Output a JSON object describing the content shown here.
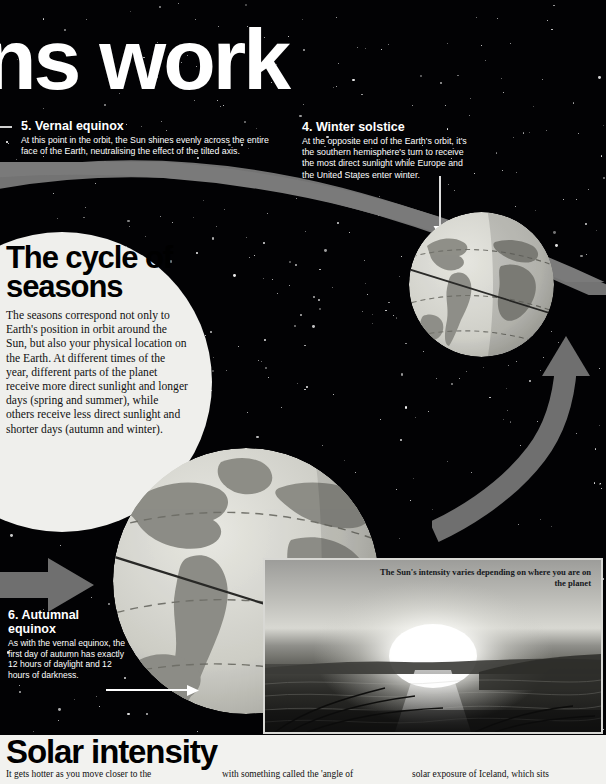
{
  "page": {
    "headline": "ns work",
    "background_color": "#020204",
    "panel_color": "#f2f2ef",
    "accent_grey": "#8a8a8a"
  },
  "annotations": [
    {
      "id": "vernal",
      "heading": "5. Vernal equinox",
      "body": "At this point in the orbit, the Sun shines evenly across the entire face of the Earth, neutralising the effect of the tilted axis."
    },
    {
      "id": "winter",
      "heading": "4. Winter solstice",
      "body": "At the opposite end of the Earth's orbit, it's the southern hemisphere's turn to receive the most direct sunlight while Europe and the United States enter winter."
    },
    {
      "id": "autumn",
      "heading": "6. Autumnal equinox",
      "body": "As with the vernal equinox, the first day of autumn has exactly 12 hours of daylight and 12 hours of darkness."
    }
  ],
  "cycle_panel": {
    "title": "The cycle of seasons",
    "body": "The seasons correspond not only to Earth's position in orbit around the Sun, but also your physical location on the Earth. At different times of the year, different parts of the planet receive more direct sunlight and longer days (spring and summer), while others receive less direct sunlight and shorter days (autumn and winter)."
  },
  "photo": {
    "caption": "The Sun's intensity varies depending on where you are on the planet",
    "alt_name": "sunset-over-water-photo"
  },
  "solar_section": {
    "title": "Solar intensity",
    "column_1": "It gets hotter as you move closer to the",
    "column_2": "with something called the 'angle of",
    "column_3": "solar exposure of Iceland, which sits"
  },
  "globes": [
    {
      "id": "winter-solstice-globe",
      "label": "earth-globe-small",
      "landmasses": "Americas, Africa, Europe"
    },
    {
      "id": "autumnal-equinox-globe",
      "label": "earth-globe-large",
      "landmasses": "Americas, Africa, Europe"
    }
  ],
  "graphics": {
    "orbit_band": "orbit-path-band",
    "arrow_left": "orbit-direction-arrow-left",
    "arrow_curve": "orbit-direction-arrow-curved"
  }
}
